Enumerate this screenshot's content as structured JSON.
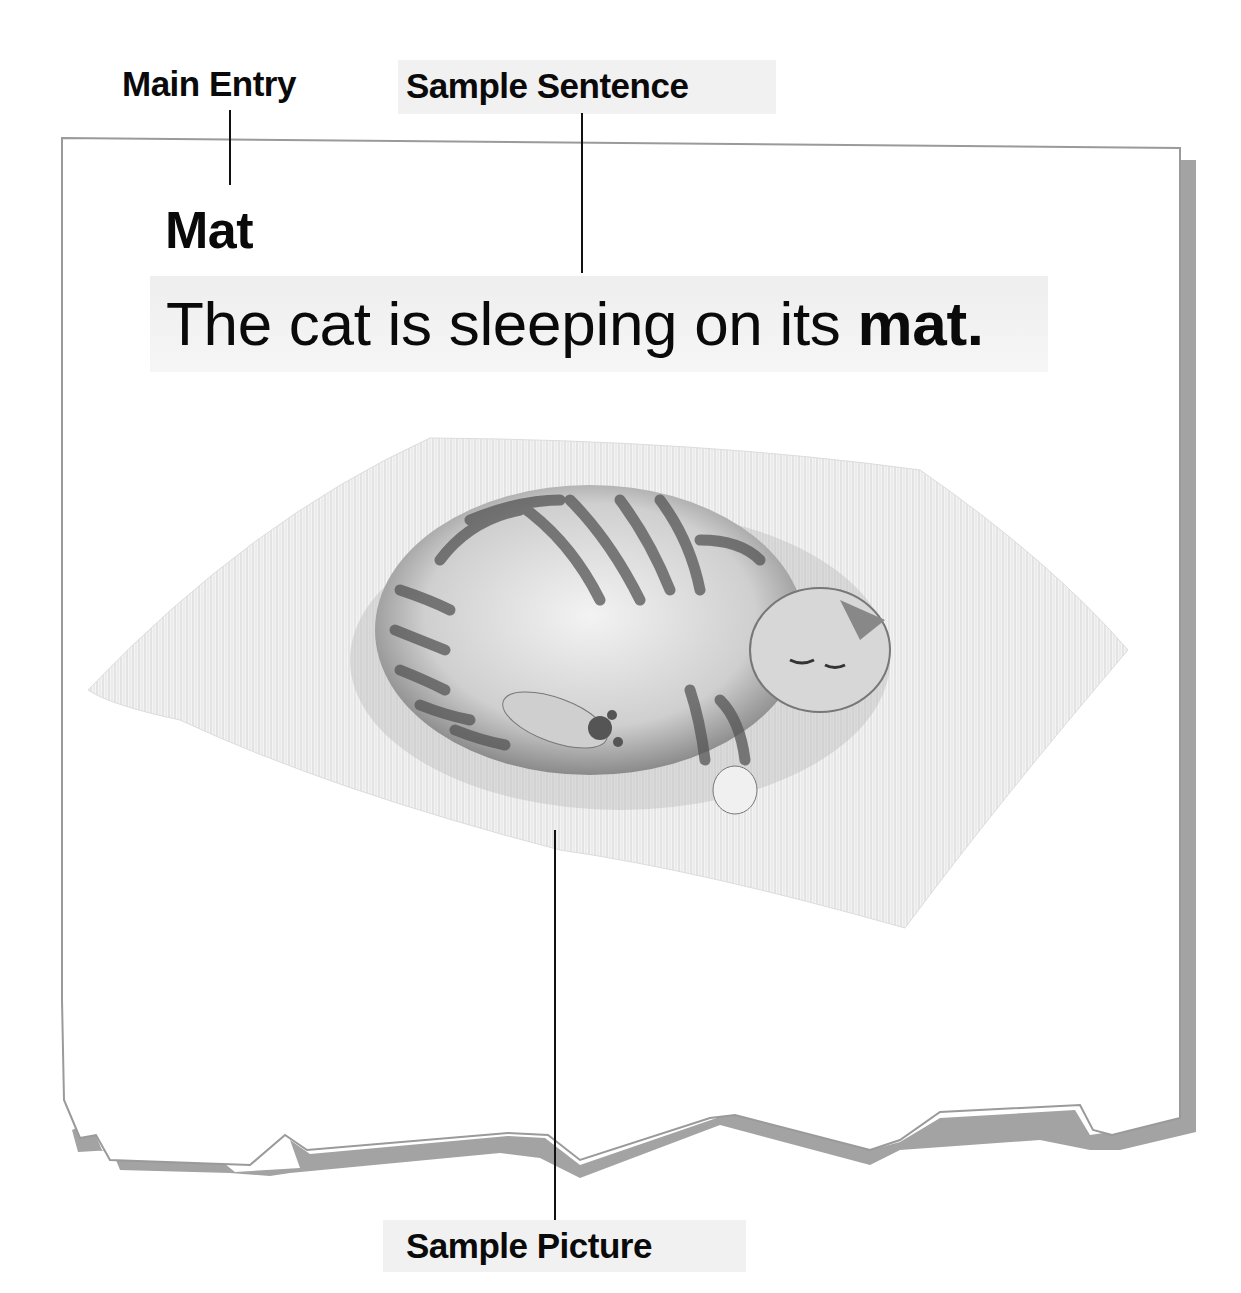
{
  "labels": {
    "main_entry": "Main Entry",
    "sample_sentence": "Sample Sentence",
    "sample_picture": "Sample Picture"
  },
  "entry": {
    "word": "Mat",
    "sentence_prefix": "The cat is sleeping on its ",
    "sentence_keyword": "mat."
  },
  "picture": {
    "subject": "sleeping tabby cat curled up on a mat",
    "icon": "cat-on-mat-illustration"
  },
  "colors": {
    "page_border": "#9a9a9a",
    "page_shadow": "#a3a3a3",
    "label_background": "#f1f1f1",
    "text": "#0a0a0a"
  }
}
